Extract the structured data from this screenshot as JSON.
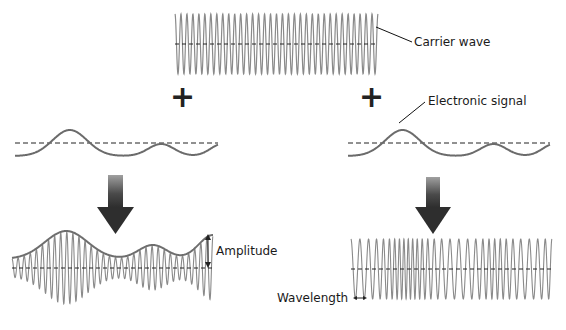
{
  "diagram": {
    "colors": {
      "wave": "#7a7a7a",
      "carrier": "#8a8a8a",
      "signal": "#6b6b6b",
      "envelope": "#6e6e6e",
      "axis": "#222222",
      "arrow_top": "#9a9a9a",
      "arrow_bottom": "#2e2e2e",
      "plus": "#222222"
    },
    "labels": {
      "carrier": "Carrier wave",
      "signal": "Electronic signal",
      "amplitude": "Amplitude",
      "wavelength": "Wavelength"
    },
    "plus_signs": [
      {
        "symbol": "+",
        "x": 170,
        "y": 96
      },
      {
        "symbol": "+",
        "x": 359,
        "y": 96
      }
    ],
    "carrier_wave": {
      "x0": 175,
      "x1": 378,
      "y_axis": 44,
      "amplitude": 30,
      "cycles": 34
    },
    "signal_left": {
      "x0": 15,
      "x1": 218,
      "y_axis": 144
    },
    "signal_right": {
      "x0": 348,
      "x1": 550,
      "y_axis": 144
    },
    "am_wave": {
      "x0": 12,
      "x1": 213,
      "y_axis": 268,
      "cycles": 33
    },
    "fm_wave": {
      "x0": 351,
      "x1": 552,
      "y_axis": 269,
      "amplitude": 30
    }
  }
}
